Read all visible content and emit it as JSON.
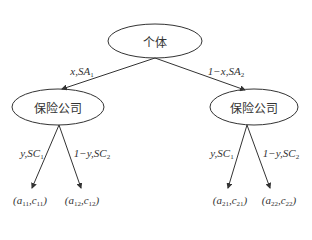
{
  "diagram": {
    "type": "game-tree",
    "root": {
      "label": "个体"
    },
    "level1": [
      {
        "label": "保险公司",
        "edge_prob": "x",
        "edge_strategy": "SA",
        "edge_strategy_sub": "1",
        "edge_prefix": ""
      },
      {
        "label": "保险公司",
        "edge_prob": "x",
        "edge_strategy": "SA",
        "edge_strategy_sub": "2",
        "edge_prefix": "1−"
      }
    ],
    "level2_edges": [
      {
        "prefix": "",
        "prob": "y",
        "strategy": "SC",
        "sub": "1"
      },
      {
        "prefix": "1−",
        "prob": "y",
        "strategy": "SC",
        "sub": "2"
      },
      {
        "prefix": "",
        "prob": "y",
        "strategy": "SC",
        "sub": "1"
      },
      {
        "prefix": "1−",
        "prob": "y",
        "strategy": "SC",
        "sub": "2"
      }
    ],
    "leaves": [
      {
        "a": "a",
        "a_sub": "11",
        "c": "c",
        "c_sub": "11"
      },
      {
        "a": "a",
        "a_sub": "12",
        "c": "c",
        "c_sub": "12"
      },
      {
        "a": "a",
        "a_sub": "21",
        "c": "c",
        "c_sub": "21"
      },
      {
        "a": "a",
        "a_sub": "22",
        "c": "c",
        "c_sub": "22"
      }
    ],
    "colors": {
      "stroke": "#333333",
      "background": "#ffffff"
    }
  }
}
